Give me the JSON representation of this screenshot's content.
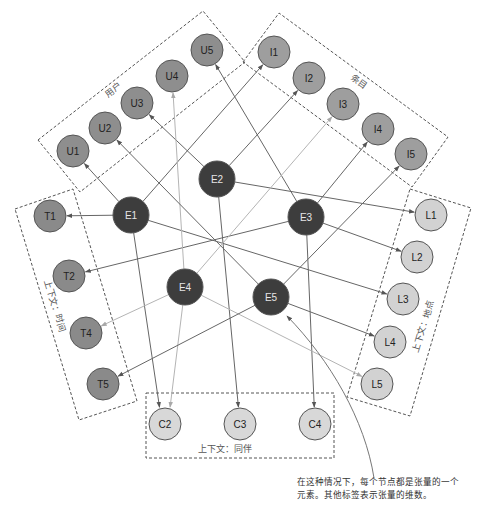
{
  "colors": {
    "hub": "#3d3d3d",
    "hub_text": "#e6e6e6",
    "user": "#8e8e8e",
    "item": "#9e9e9e",
    "time": "#8a8a8a",
    "location": "#d2d2d2",
    "companion": "#d8d8d8",
    "leaf_text": "#222222",
    "edge_dark": "#666666",
    "edge_light": "#b4b4b4"
  },
  "groups": [
    {
      "id": "users",
      "label": "用户"
    },
    {
      "id": "items",
      "label": "条目"
    },
    {
      "id": "time",
      "label": "上下文：时间"
    },
    {
      "id": "location",
      "label": "上下文：地点"
    },
    {
      "id": "companion",
      "label": "上下文：同伴"
    }
  ],
  "nodes": [
    {
      "id": "E1",
      "group": "hub",
      "x": 131,
      "y": 215,
      "r": 18
    },
    {
      "id": "E2",
      "group": "hub",
      "x": 217,
      "y": 179,
      "r": 18
    },
    {
      "id": "E3",
      "group": "hub",
      "x": 306,
      "y": 217,
      "r": 18
    },
    {
      "id": "E4",
      "group": "hub",
      "x": 185,
      "y": 287,
      "r": 18
    },
    {
      "id": "E5",
      "group": "hub",
      "x": 271,
      "y": 297,
      "r": 18
    },
    {
      "id": "U1",
      "group": "user",
      "x": 73,
      "y": 151,
      "r": 16
    },
    {
      "id": "U2",
      "group": "user",
      "x": 105,
      "y": 128,
      "r": 16
    },
    {
      "id": "U3",
      "group": "user",
      "x": 137,
      "y": 103,
      "r": 16
    },
    {
      "id": "U4",
      "group": "user",
      "x": 172,
      "y": 76,
      "r": 16
    },
    {
      "id": "U5",
      "group": "user",
      "x": 207,
      "y": 50,
      "r": 16
    },
    {
      "id": "I1",
      "group": "item",
      "x": 274,
      "y": 52,
      "r": 16
    },
    {
      "id": "I2",
      "group": "item",
      "x": 309,
      "y": 78,
      "r": 16
    },
    {
      "id": "I3",
      "group": "item",
      "x": 343,
      "y": 104,
      "r": 16
    },
    {
      "id": "I4",
      "group": "item",
      "x": 378,
      "y": 129,
      "r": 16
    },
    {
      "id": "I5",
      "group": "item",
      "x": 411,
      "y": 154,
      "r": 16
    },
    {
      "id": "T1",
      "group": "time",
      "x": 50,
      "y": 216,
      "r": 16
    },
    {
      "id": "T2",
      "group": "time",
      "x": 69,
      "y": 276,
      "r": 16
    },
    {
      "id": "T4",
      "group": "time",
      "x": 86,
      "y": 333,
      "r": 16
    },
    {
      "id": "T5",
      "group": "time",
      "x": 103,
      "y": 384,
      "r": 16
    },
    {
      "id": "L1",
      "group": "location",
      "x": 431,
      "y": 215,
      "r": 16
    },
    {
      "id": "L2",
      "group": "location",
      "x": 417,
      "y": 257,
      "r": 16
    },
    {
      "id": "L3",
      "group": "location",
      "x": 403,
      "y": 299,
      "r": 16
    },
    {
      "id": "L4",
      "group": "location",
      "x": 390,
      "y": 342,
      "r": 16
    },
    {
      "id": "L5",
      "group": "location",
      "x": 377,
      "y": 384,
      "r": 16
    },
    {
      "id": "C2",
      "group": "companion",
      "x": 165,
      "y": 424,
      "r": 16
    },
    {
      "id": "C3",
      "group": "companion",
      "x": 240,
      "y": 424,
      "r": 16
    },
    {
      "id": "C4",
      "group": "companion",
      "x": 315,
      "y": 424,
      "r": 16
    }
  ],
  "edges": [
    {
      "from": "E1",
      "to": "U1",
      "tone": "dark"
    },
    {
      "from": "E1",
      "to": "I1",
      "tone": "dark"
    },
    {
      "from": "E1",
      "to": "T1",
      "tone": "dark"
    },
    {
      "from": "E1",
      "to": "L3",
      "tone": "dark"
    },
    {
      "from": "E1",
      "to": "C2",
      "tone": "dark",
      "dx": -3
    },
    {
      "from": "E2",
      "to": "U3",
      "tone": "dark"
    },
    {
      "from": "E2",
      "to": "I2",
      "tone": "dark"
    },
    {
      "from": "E2",
      "to": "L1",
      "tone": "dark"
    },
    {
      "from": "E2",
      "to": "C3",
      "tone": "dark"
    },
    {
      "from": "E3",
      "to": "U5",
      "tone": "dark"
    },
    {
      "from": "E3",
      "to": "I4",
      "tone": "dark"
    },
    {
      "from": "E3",
      "to": "T2",
      "tone": "dark"
    },
    {
      "from": "E3",
      "to": "L2",
      "tone": "dark"
    },
    {
      "from": "E3",
      "to": "C4",
      "tone": "dark"
    },
    {
      "from": "E4",
      "to": "U4",
      "tone": "light"
    },
    {
      "from": "E4",
      "to": "I3",
      "tone": "light"
    },
    {
      "from": "E4",
      "to": "T4",
      "tone": "light"
    },
    {
      "from": "E4",
      "to": "L5",
      "tone": "light"
    },
    {
      "from": "E4",
      "to": "C2",
      "tone": "light",
      "dx": 3
    },
    {
      "from": "E5",
      "to": "U2",
      "tone": "dark"
    },
    {
      "from": "E5",
      "to": "I5",
      "tone": "dark"
    },
    {
      "from": "E5",
      "to": "T5",
      "tone": "dark"
    },
    {
      "from": "E5",
      "to": "L4",
      "tone": "dark"
    }
  ],
  "annotation": {
    "text": "在这种情况下，每个节点都是张量的一个元素。其他标签表示张量的维数。"
  }
}
